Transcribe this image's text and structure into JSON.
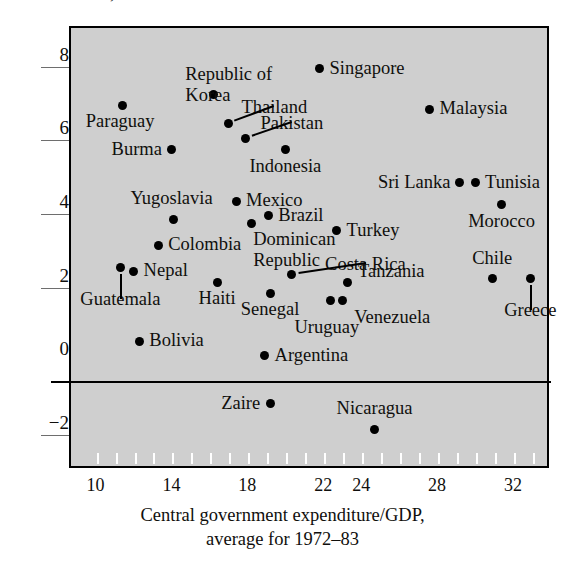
{
  "caption_sliver": "Growth of GDP, 1972-83",
  "chart_data": {
    "type": "scatter",
    "title": "",
    "xlabel": "Central government expenditure/GDP,\naverage for 1972–83",
    "xlabel_line1": "Central government expenditure/GDP,",
    "xlabel_line2": "average for 1972–83",
    "ylabel": "",
    "xlim": [
      8.6,
      33.9
    ],
    "ylim": [
      -2.9,
      9.1
    ],
    "xticks": [
      10,
      14,
      18,
      22,
      24,
      28,
      32
    ],
    "xtick_labels": [
      "10",
      "14",
      "18",
      "22",
      "24",
      "28",
      "32"
    ],
    "yticks": [
      8,
      6,
      4,
      2,
      0,
      -2
    ],
    "ytick_labels": [
      "8",
      "6",
      "4",
      "2",
      "0",
      "−2"
    ],
    "grid": false,
    "zero_line": 0,
    "legend": "none",
    "plot_background": "#cfcfcf",
    "marker_color": "#000000",
    "points": [
      {
        "name": "Republic of Korea",
        "x": 16.1,
        "y": 7.3,
        "label_dx": 18,
        "label_dy": -30,
        "label_anchor": "center",
        "leader": false
      },
      {
        "name": "Singapore",
        "x": 21.7,
        "y": 8.0,
        "label_dx": 10,
        "label_dy": -11,
        "label_anchor": "left",
        "leader": false
      },
      {
        "name": "Paraguay",
        "x": 11.3,
        "y": 7.0,
        "label_dx": -2,
        "label_dy": 6,
        "label_anchor": "center",
        "leader": false
      },
      {
        "name": "Malaysia",
        "x": 27.5,
        "y": 6.9,
        "label_dx": 10,
        "label_dy": -11,
        "label_anchor": "left",
        "leader": false
      },
      {
        "name": "Thailand",
        "x": 16.9,
        "y": 6.5,
        "label_dx": 13,
        "label_dy": -27,
        "label_anchor": "left",
        "leader": true
      },
      {
        "name": "Pakistan",
        "x": 17.8,
        "y": 6.1,
        "label_dx": 15,
        "label_dy": -26,
        "label_anchor": "left",
        "leader": true
      },
      {
        "name": "Burma",
        "x": 13.9,
        "y": 5.8,
        "label_dx": -10,
        "label_dy": -11,
        "label_anchor": "right",
        "leader": false
      },
      {
        "name": "Indonesia",
        "x": 19.9,
        "y": 5.8,
        "label_dx": 0,
        "label_dy": 6,
        "label_anchor": "center",
        "leader": false
      },
      {
        "name": "Sri Lanka",
        "x": 29.1,
        "y": 4.9,
        "label_dx": -10,
        "label_dy": -11,
        "label_anchor": "right",
        "leader": false
      },
      {
        "name": "Tunisia",
        "x": 29.9,
        "y": 4.9,
        "label_dx": 10,
        "label_dy": -11,
        "label_anchor": "left",
        "leader": false
      },
      {
        "name": "Mexico",
        "x": 17.3,
        "y": 4.4,
        "label_dx": 10,
        "label_dy": -11,
        "label_anchor": "left",
        "leader": false
      },
      {
        "name": "Morocco",
        "x": 31.3,
        "y": 4.3,
        "label_dx": 0,
        "label_dy": 6,
        "label_anchor": "center",
        "leader": false
      },
      {
        "name": "Brazil",
        "x": 19.0,
        "y": 4.0,
        "label_dx": 10,
        "label_dy": -11,
        "label_anchor": "left",
        "leader": false
      },
      {
        "name": "Yugoslavia",
        "x": 14.0,
        "y": 3.9,
        "label_dx": -2,
        "label_dy": -32,
        "label_anchor": "center",
        "leader": false
      },
      {
        "name": "Dominican Republic",
        "x": 18.1,
        "y": 3.8,
        "label_dx": 2,
        "label_dy": 6,
        "label_anchor": "left",
        "leader": false
      },
      {
        "name": "Turkey",
        "x": 22.6,
        "y": 3.6,
        "label_dx": 10,
        "label_dy": -11,
        "label_anchor": "left",
        "leader": false
      },
      {
        "name": "Colombia",
        "x": 13.2,
        "y": 3.2,
        "label_dx": 10,
        "label_dy": -11,
        "label_anchor": "left",
        "leader": false
      },
      {
        "name": "Costa Rica",
        "x": 20.2,
        "y": 2.4,
        "label_dx": 34,
        "label_dy": -21,
        "label_anchor": "left",
        "leader": true
      },
      {
        "name": "Chile",
        "x": 30.8,
        "y": 2.3,
        "label_dx": 0,
        "label_dy": -30,
        "label_anchor": "center",
        "leader": false
      },
      {
        "name": "Nepal",
        "x": 11.9,
        "y": 2.5,
        "label_dx": 10,
        "label_dy": -11,
        "label_anchor": "left",
        "leader": false
      },
      {
        "name": "Guatemala",
        "x": 11.2,
        "y": 2.6,
        "label_dx": 0,
        "label_dy": 22,
        "label_anchor": "center",
        "leader": true
      },
      {
        "name": "Tanzania",
        "x": 23.2,
        "y": 2.2,
        "label_dx": 10,
        "label_dy": -21,
        "label_anchor": "left",
        "leader": false
      },
      {
        "name": "Greece",
        "x": 32.8,
        "y": 2.3,
        "label_dx": 0,
        "label_dy": 22,
        "label_anchor": "center",
        "leader": true
      },
      {
        "name": "Haiti",
        "x": 16.3,
        "y": 2.2,
        "label_dx": 0,
        "label_dy": 6,
        "label_anchor": "center",
        "leader": false
      },
      {
        "name": "Senegal",
        "x": 19.1,
        "y": 1.9,
        "label_dx": 0,
        "label_dy": 6,
        "label_anchor": "center",
        "leader": false
      },
      {
        "name": "Uruguay",
        "x": 22.3,
        "y": 1.7,
        "label_dx": -4,
        "label_dy": 16,
        "label_anchor": "center",
        "leader": false
      },
      {
        "name": "Venezuela",
        "x": 22.9,
        "y": 1.7,
        "label_dx": 12,
        "label_dy": 6,
        "label_anchor": "left",
        "leader": false
      },
      {
        "name": "Bolivia",
        "x": 12.2,
        "y": 0.6,
        "label_dx": 10,
        "label_dy": -11,
        "label_anchor": "left",
        "leader": false
      },
      {
        "name": "Argentina",
        "x": 18.8,
        "y": 0.2,
        "label_dx": 10,
        "label_dy": -11,
        "label_anchor": "left",
        "leader": false
      },
      {
        "name": "Zaire",
        "x": 19.1,
        "y": -1.1,
        "label_dx": -10,
        "label_dy": -11,
        "label_anchor": "right",
        "leader": false
      },
      {
        "name": "Nicaragua",
        "x": 24.6,
        "y": -1.8,
        "label_dx": 0,
        "label_dy": -31,
        "label_anchor": "center",
        "leader": false
      }
    ]
  }
}
